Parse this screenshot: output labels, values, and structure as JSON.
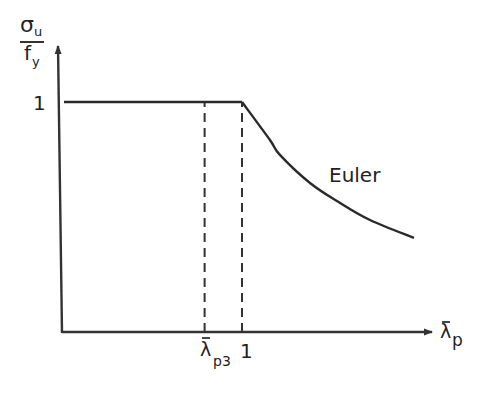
{
  "chart_data": {
    "type": "line",
    "title": "",
    "ylabel": {
      "numerator": "σ",
      "numerator_sub": "u",
      "denominator": "f",
      "denominator_sub": "y"
    },
    "xlabel": {
      "symbol": "λ",
      "bar": true,
      "sub": "p"
    },
    "ylim": [
      0,
      1.2
    ],
    "xlim": [
      0,
      2.2
    ],
    "y_ticks": [
      {
        "value": 1,
        "label": "1"
      }
    ],
    "x_ticks": [
      {
        "value": 0.79,
        "label": "λ",
        "bar": true,
        "sub": "p3"
      },
      {
        "value": 1.0,
        "label": "1"
      }
    ],
    "grid": false,
    "series": [
      {
        "name": "Plateau",
        "points": [
          [
            0,
            1.0
          ],
          [
            1.0,
            1.0
          ]
        ]
      },
      {
        "name": "Euler",
        "points": [
          [
            1.0,
            1.0
          ],
          [
            1.157,
            0.835
          ],
          [
            1.213,
            0.77
          ],
          [
            1.382,
            0.648
          ],
          [
            1.551,
            0.561
          ],
          [
            1.719,
            0.487
          ],
          [
            1.966,
            0.409
          ]
        ]
      }
    ],
    "reference_lines": [
      {
        "x": 0.79,
        "from": 0,
        "to": 1.0,
        "style": "dashed"
      },
      {
        "x": 1.0,
        "from": 0,
        "to": 1.0,
        "style": "dashed"
      }
    ],
    "annotations": [
      {
        "text": "Euler",
        "near": "curve-right"
      }
    ]
  }
}
